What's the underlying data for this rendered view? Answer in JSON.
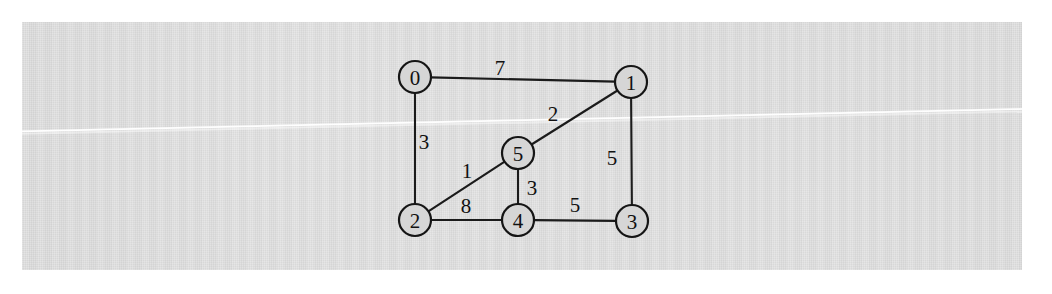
{
  "document": {
    "kind": "scanned-figure",
    "background_color": "#d6d6d6",
    "page_color": "#ffffff",
    "ink_color": "#151515"
  },
  "chart_data": {
    "type": "diagram",
    "diagram_type": "undirected-weighted-graph",
    "title": "",
    "nodes": [
      {
        "id": "0",
        "label": "0",
        "x": 415,
        "y": 77,
        "r": 16
      },
      {
        "id": "1",
        "label": "1",
        "x": 631,
        "y": 82,
        "r": 16
      },
      {
        "id": "2",
        "label": "2",
        "x": 415,
        "y": 220,
        "r": 16
      },
      {
        "id": "3",
        "label": "3",
        "x": 632,
        "y": 221,
        "r": 16
      },
      {
        "id": "4",
        "label": "4",
        "x": 518,
        "y": 220,
        "r": 16
      },
      {
        "id": "5",
        "label": "5",
        "x": 518,
        "y": 153,
        "r": 16
      }
    ],
    "edges": [
      {
        "source": "0",
        "target": "1",
        "weight": 7,
        "label": "7",
        "lx": 500,
        "ly": 68
      },
      {
        "source": "0",
        "target": "2",
        "weight": 3,
        "label": "3",
        "lx": 424,
        "ly": 142
      },
      {
        "source": "1",
        "target": "5",
        "weight": 2,
        "label": "2",
        "lx": 553,
        "ly": 114
      },
      {
        "source": "1",
        "target": "3",
        "weight": 5,
        "label": "5",
        "lx": 612,
        "ly": 158
      },
      {
        "source": "2",
        "target": "5",
        "weight": 1,
        "label": "1",
        "lx": 467,
        "ly": 171
      },
      {
        "source": "2",
        "target": "4",
        "weight": 8,
        "label": "8",
        "lx": 466,
        "ly": 206
      },
      {
        "source": "5",
        "target": "4",
        "weight": 3,
        "label": "3",
        "lx": 532,
        "ly": 188
      },
      {
        "source": "4",
        "target": "3",
        "weight": 5,
        "label": "5",
        "lx": 575,
        "ly": 205
      }
    ],
    "node_count": 6,
    "edge_count": 8,
    "weights": [
      7,
      3,
      2,
      5,
      1,
      8,
      3,
      5
    ],
    "node_labels": [
      "0",
      "1",
      "2",
      "3",
      "4",
      "5"
    ],
    "legend": [],
    "annotations": []
  }
}
